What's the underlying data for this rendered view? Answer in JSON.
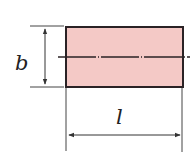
{
  "diagram": {
    "type": "dimensioned-rectangle",
    "labels": {
      "height": "b",
      "length": "l"
    },
    "colors": {
      "fill": "#f4c9c6",
      "stroke": "#2a2225",
      "line": "#333333"
    },
    "rectangle": {
      "x": 66,
      "y": 27,
      "width": 117,
      "height": 60
    },
    "centerline": {
      "y": 57,
      "x1": 58,
      "x2": 190,
      "style": "dash-dot"
    },
    "dimension_b": {
      "x": 45,
      "y1": 27,
      "y2": 87
    },
    "dimension_l": {
      "y": 135,
      "x1": 67,
      "x2": 182
    }
  }
}
